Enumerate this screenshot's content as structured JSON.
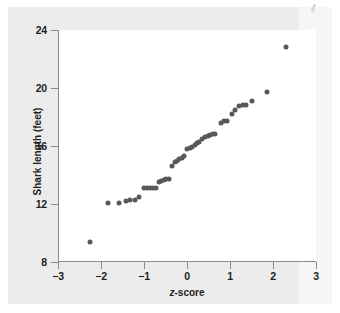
{
  "chart_data": {
    "type": "scatter",
    "title": "",
    "subtitle": "",
    "xlabel": "z-score",
    "xlabel_italic_prefix": "z",
    "xlabel_rest": "-score",
    "ylabel": "Shark length (feet)",
    "xlim": [
      -3,
      3
    ],
    "ylim": [
      8,
      24
    ],
    "xticks": [
      -3,
      -2,
      -1,
      0,
      1,
      2,
      3
    ],
    "xticklabels": [
      "−3",
      "−2",
      "−1",
      "0",
      "1",
      "2",
      "3"
    ],
    "yticks": [
      8,
      12,
      16,
      20,
      24
    ],
    "yticklabels": [
      "8",
      "12",
      "16",
      "20",
      "24"
    ],
    "grid": false,
    "legend": null,
    "marker_color": "#58585a",
    "axis_color": "#8a8a8a",
    "background_color": "#ececec",
    "plot_background_color": "#ffffff",
    "series": [
      {
        "name": "Shark lengths normal quantile plot",
        "points": [
          {
            "x": -2.25,
            "y": 9.4
          },
          {
            "x": -1.83,
            "y": 12.05
          },
          {
            "x": -1.58,
            "y": 12.1
          },
          {
            "x": -1.43,
            "y": 12.2
          },
          {
            "x": -1.32,
            "y": 12.25
          },
          {
            "x": -1.22,
            "y": 12.3
          },
          {
            "x": -1.12,
            "y": 12.45
          },
          {
            "x": -1.0,
            "y": 13.1
          },
          {
            "x": -0.93,
            "y": 13.1
          },
          {
            "x": -0.86,
            "y": 13.1
          },
          {
            "x": -0.8,
            "y": 13.1
          },
          {
            "x": -0.73,
            "y": 13.1
          },
          {
            "x": -0.66,
            "y": 13.5
          },
          {
            "x": -0.6,
            "y": 13.6
          },
          {
            "x": -0.54,
            "y": 13.65
          },
          {
            "x": -0.48,
            "y": 13.7
          },
          {
            "x": -0.42,
            "y": 13.75
          },
          {
            "x": -0.35,
            "y": 14.6
          },
          {
            "x": -0.29,
            "y": 14.9
          },
          {
            "x": -0.24,
            "y": 15.0
          },
          {
            "x": -0.18,
            "y": 15.1
          },
          {
            "x": -0.12,
            "y": 15.2
          },
          {
            "x": -0.06,
            "y": 15.3
          },
          {
            "x": 0.0,
            "y": 15.8
          },
          {
            "x": 0.06,
            "y": 15.85
          },
          {
            "x": 0.12,
            "y": 15.95
          },
          {
            "x": 0.18,
            "y": 16.1
          },
          {
            "x": 0.24,
            "y": 16.2
          },
          {
            "x": 0.29,
            "y": 16.25
          },
          {
            "x": 0.35,
            "y": 16.45
          },
          {
            "x": 0.42,
            "y": 16.6
          },
          {
            "x": 0.48,
            "y": 16.7
          },
          {
            "x": 0.54,
            "y": 16.75
          },
          {
            "x": 0.6,
            "y": 16.8
          },
          {
            "x": 0.66,
            "y": 16.85
          },
          {
            "x": 0.8,
            "y": 17.6
          },
          {
            "x": 0.86,
            "y": 17.7
          },
          {
            "x": 0.93,
            "y": 17.75
          },
          {
            "x": 1.05,
            "y": 18.2
          },
          {
            "x": 1.12,
            "y": 18.5
          },
          {
            "x": 1.22,
            "y": 18.75
          },
          {
            "x": 1.3,
            "y": 18.8
          },
          {
            "x": 1.37,
            "y": 18.8
          },
          {
            "x": 1.52,
            "y": 19.1
          },
          {
            "x": 1.85,
            "y": 19.7
          },
          {
            "x": 2.3,
            "y": 22.8
          }
        ]
      }
    ]
  }
}
